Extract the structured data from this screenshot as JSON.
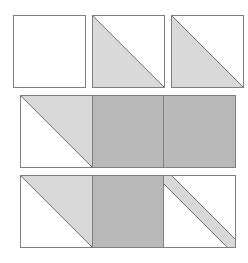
{
  "diagram": {
    "colors": {
      "background": "#ffffff",
      "light_fabric": "#d9d9d9",
      "dark_fabric": "#b9b9b9",
      "outline": "#7f7f7f",
      "white_fabric": "#ffffff"
    },
    "rows": [
      {
        "id": "row-1",
        "units": [
          {
            "type": "plain-square",
            "fill": "white"
          },
          {
            "type": "half-square-triangle",
            "fill": "light",
            "position": "bottom-left"
          },
          {
            "type": "half-square-triangle",
            "fill": "light",
            "position": "bottom-left"
          }
        ]
      },
      {
        "id": "row-2",
        "units": [
          {
            "type": "half-square-triangle",
            "fill": "light",
            "position": "top-right"
          },
          {
            "type": "plain-square",
            "fill": "dark"
          },
          {
            "type": "plain-square",
            "fill": "dark"
          }
        ]
      },
      {
        "id": "row-3",
        "units": [
          {
            "type": "half-square-triangle",
            "fill": "light",
            "position": "top-right"
          },
          {
            "type": "plain-square",
            "fill": "dark"
          },
          {
            "type": "diagonal-strip",
            "fill": "light"
          }
        ]
      }
    ]
  }
}
